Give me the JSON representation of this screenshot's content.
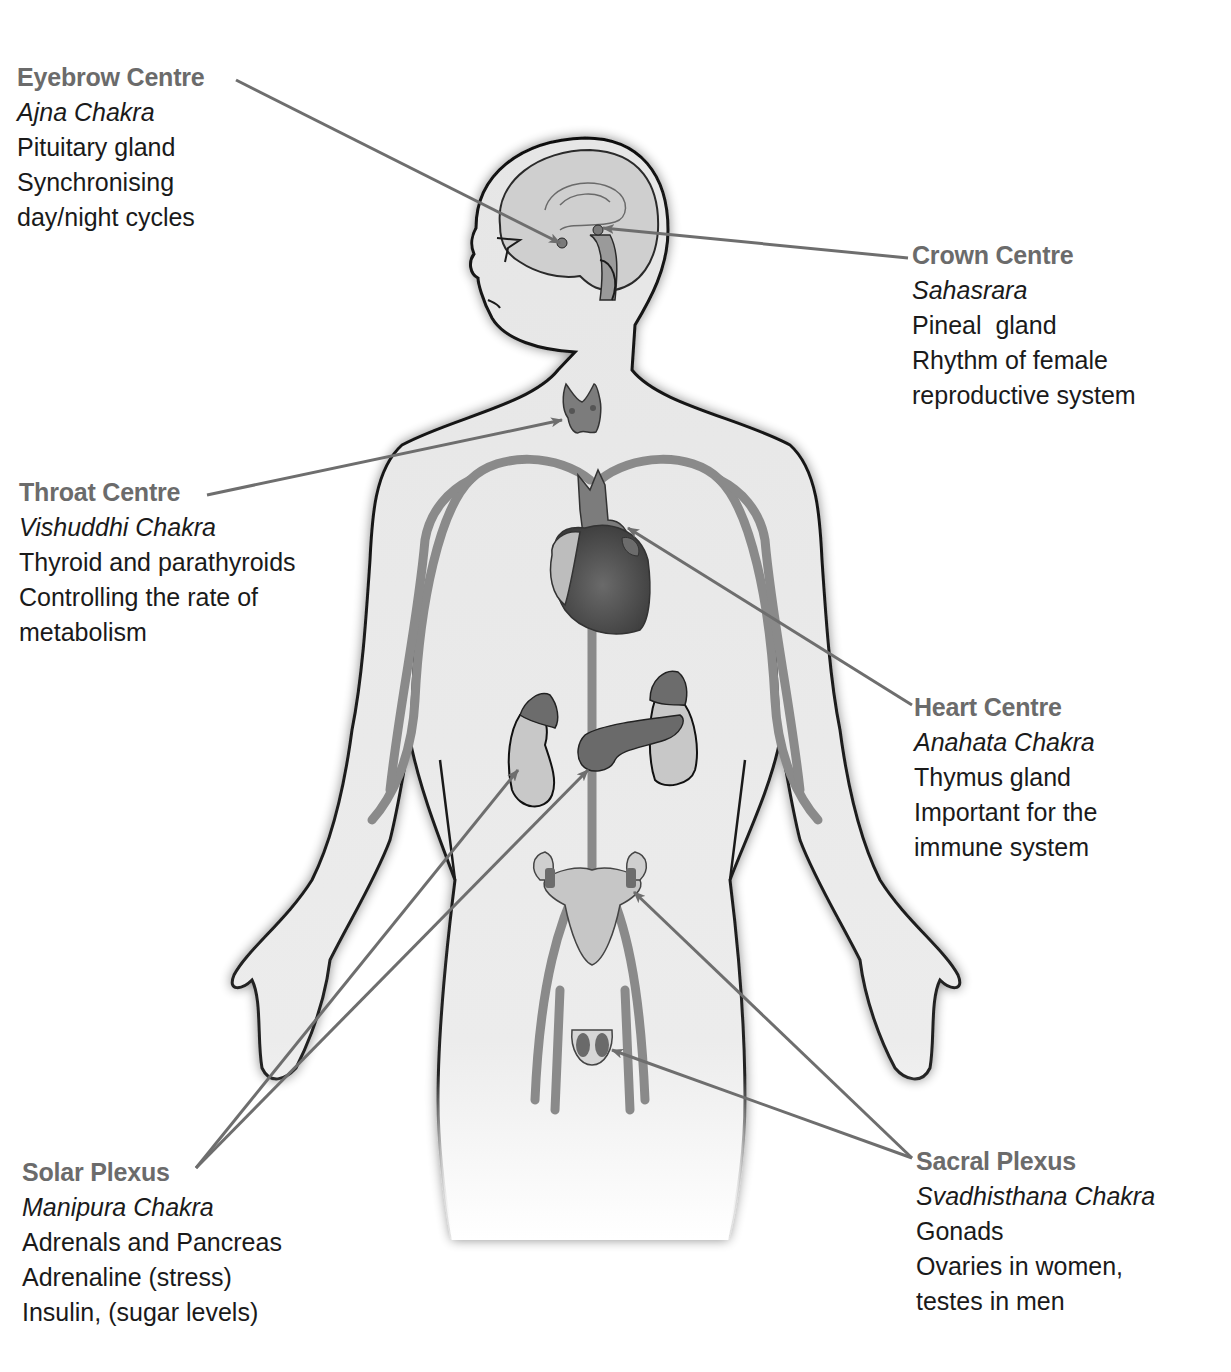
{
  "diagram": {
    "type": "anatomical-illustration",
    "colors": {
      "title_text": "#6b6b6b",
      "body_text": "#1a1a1a",
      "arrow": "#6e6e6e",
      "skin_fill": "#e9e9e9",
      "outline": "#111111",
      "organ_dark": "#5a5a5a",
      "organ_mid": "#8a8a8a",
      "organ_light": "#c4c4c4"
    }
  },
  "labels": {
    "eyebrow": {
      "title": "Eyebrow Centre",
      "sanskrit": "Ajna Chakra",
      "lines": [
        "Pituitary gland",
        "Synchronising",
        "day/night cycles"
      ],
      "points_to": "pituitary gland"
    },
    "crown": {
      "title": "Crown Centre",
      "sanskrit": "Sahasrara",
      "lines": [
        "Pineal  gland",
        "Rhythm of female",
        "reproductive system"
      ],
      "points_to": "pineal gland"
    },
    "throat": {
      "title": "Throat Centre",
      "sanskrit": "Vishuddhi Chakra",
      "lines": [
        "Thyroid and parathyroids",
        "Controlling the rate of",
        "metabolism"
      ],
      "points_to": "thyroid"
    },
    "heart": {
      "title": "Heart Centre",
      "sanskrit": "Anahata Chakra",
      "lines": [
        "Thymus gland",
        "Important for the",
        "immune system"
      ],
      "points_to": "thymus"
    },
    "solar": {
      "title": "Solar Plexus",
      "sanskrit": "Manipura Chakra",
      "lines": [
        "Adrenals and Pancreas",
        "Adrenaline (stress)",
        "Insulin, (sugar levels)"
      ],
      "points_to": "adrenals and pancreas"
    },
    "sacral": {
      "title": "Sacral Plexus",
      "sanskrit": "Svadhisthana Chakra",
      "lines": [
        "Gonads",
        "Ovaries in women,",
        "testes in men"
      ],
      "points_to": "ovaries and testes"
    }
  }
}
